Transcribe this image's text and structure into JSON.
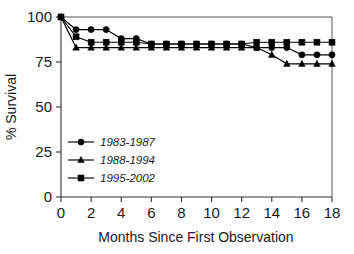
{
  "chart_data": {
    "type": "line",
    "title": "",
    "xlabel": "Months Since First Observation",
    "ylabel": "% Survival",
    "xlim": [
      0,
      18
    ],
    "ylim": [
      0,
      100
    ],
    "xticks": [
      0,
      2,
      4,
      6,
      8,
      10,
      12,
      14,
      16,
      18
    ],
    "xtick_labels": [
      "0",
      "2",
      "4",
      "6",
      "8",
      "10",
      "12",
      "14",
      "16",
      "18"
    ],
    "yticks": [
      0,
      25,
      50,
      75,
      100
    ],
    "ytick_labels": [
      "0",
      "25",
      "50",
      "75",
      "100"
    ],
    "grid": false,
    "legend_position": "lower-left-inside",
    "x": [
      0,
      1,
      2,
      3,
      4,
      5,
      6,
      7,
      8,
      9,
      10,
      11,
      12,
      13,
      14,
      15,
      16,
      17,
      18
    ],
    "series": [
      {
        "name": "1983-1987",
        "marker": "circle",
        "color": "#000000",
        "values": [
          100,
          93,
          93,
          93,
          88,
          88,
          85,
          85,
          85,
          85,
          85,
          85,
          85,
          83,
          83,
          83,
          79,
          79,
          79
        ]
      },
      {
        "name": "1988-1994",
        "marker": "triangle",
        "color": "#000000",
        "values": [
          100,
          83,
          83,
          83,
          83,
          83,
          83,
          83,
          83,
          83,
          83,
          83,
          83,
          83,
          79,
          74,
          74,
          74,
          74
        ]
      },
      {
        "name": "1995-2002",
        "marker": "square",
        "color": "#000000",
        "values": [
          100,
          89,
          86,
          86,
          86,
          86,
          85,
          85,
          85,
          85,
          85,
          85,
          85,
          86,
          86,
          86,
          86,
          86,
          86
        ]
      }
    ]
  },
  "legend": {
    "entries": [
      {
        "label": "1983-1987",
        "marker": "circle"
      },
      {
        "label": "1988-1994",
        "marker": "triangle"
      },
      {
        "label": "1995-2002",
        "marker": "square"
      }
    ]
  },
  "colors": {
    "ink": "#000000",
    "axis": "#333333",
    "frame": "#555555",
    "background": "#ffffff"
  }
}
